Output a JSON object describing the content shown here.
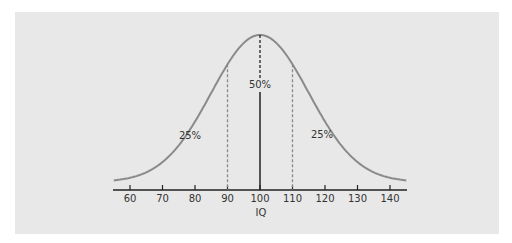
{
  "chart_data": {
    "type": "line",
    "title": "",
    "xlabel": "IQ",
    "ylabel": "",
    "xlim": [
      55,
      145
    ],
    "x_ticks": [
      60,
      70,
      80,
      90,
      100,
      110,
      120,
      130,
      140
    ],
    "x_tick_labels": [
      "60",
      "70",
      "80",
      "90",
      "100",
      "110",
      "120",
      "130",
      "140"
    ],
    "distribution": {
      "kind": "normal",
      "mean": 100,
      "sd": 15
    },
    "reference_lines": [
      {
        "x": 90,
        "style": "dashed"
      },
      {
        "x": 100,
        "style": "solid-with-dashed-top"
      },
      {
        "x": 110,
        "style": "dashed"
      }
    ],
    "annotations": [
      {
        "text": "25%",
        "region": "left of 90"
      },
      {
        "text": "50%",
        "region": "between 90 and 110"
      },
      {
        "text": "25%",
        "region": "right of 110"
      }
    ],
    "grid": false,
    "legend": null,
    "colors": {
      "curve": "#8a8a8a",
      "axis": "#222222",
      "background": "#e8e8e8",
      "dashed": "#8a8a8a"
    }
  },
  "labels": {
    "left_pct": "25%",
    "center_pct": "50%",
    "right_pct": "25%",
    "xlabel": "IQ",
    "ticks": [
      "60",
      "70",
      "80",
      "90",
      "100",
      "110",
      "120",
      "130",
      "140"
    ]
  }
}
